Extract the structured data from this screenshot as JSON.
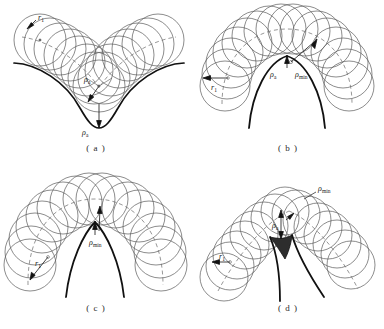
{
  "figure": {
    "type": "technical-line-diagram",
    "stroke_colors": {
      "circle": "#5a5a5a",
      "envelope": "#111111",
      "centerpath": "#6a6a6a",
      "arrow": "#111111",
      "text": "#1a1a1a"
    },
    "background": "#ffffff"
  },
  "panels": [
    {
      "id": "a",
      "caption": "( a )",
      "labels": [
        {
          "name": "rho-a-bottom",
          "symbol": "ρ",
          "subscript": "a"
        },
        {
          "name": "rho-a-center",
          "symbol": "ρ",
          "subscript": "a"
        },
        {
          "name": "r1-upper-left",
          "symbol": "r",
          "subscript": "1"
        }
      ]
    },
    {
      "id": "b",
      "caption": "( b )",
      "labels": [
        {
          "name": "rho-a",
          "symbol": "ρ",
          "subscript": "a"
        },
        {
          "name": "rho-min",
          "symbol": "ρ",
          "subscript": "min"
        },
        {
          "name": "r1",
          "symbol": "r",
          "subscript": "1"
        }
      ]
    },
    {
      "id": "c",
      "caption": "( c )",
      "labels": [
        {
          "name": "rho-min",
          "symbol": "ρ",
          "subscript": "min"
        },
        {
          "name": "r1",
          "symbol": "r",
          "subscript": "1"
        }
      ]
    },
    {
      "id": "d",
      "caption": "( d )",
      "labels": [
        {
          "name": "rho-min",
          "symbol": "ρ",
          "subscript": "min"
        },
        {
          "name": "rho-a",
          "symbol": "ρ",
          "subscript": "a"
        },
        {
          "name": "r1",
          "symbol": "r",
          "subscript": "1"
        }
      ]
    }
  ],
  "symbols": {
    "rho": "ρ",
    "sub_a": "a",
    "sub_min": "min",
    "r": "r",
    "sub_1": "1"
  }
}
